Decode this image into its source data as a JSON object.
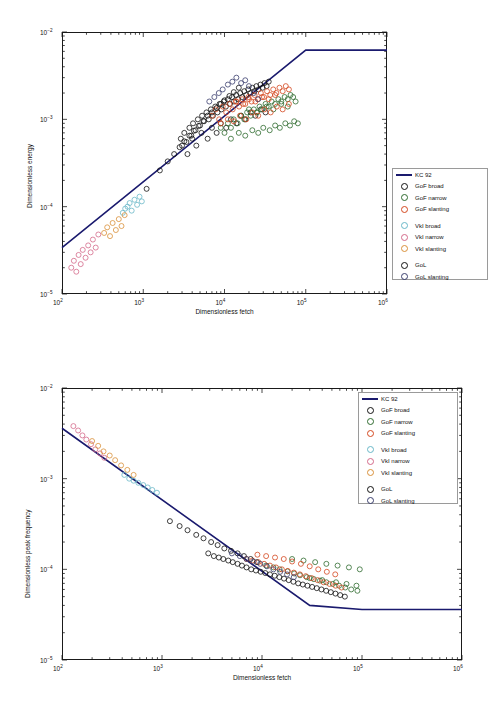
{
  "figure": {
    "panels": [
      {
        "label": "(a)"
      },
      {
        "label": "(b)"
      }
    ]
  },
  "legend": {
    "items": [
      {
        "type": "line",
        "label": "KC 92",
        "color": "#1a1a6e"
      },
      {
        "type": "circle",
        "label": "GoF broad",
        "color": "#111111"
      },
      {
        "type": "circle",
        "label": "GoF narrow",
        "color": "#2f6b2f"
      },
      {
        "type": "circle",
        "label": "GoF slanting",
        "color": "#d4481f"
      },
      {
        "type": "gap",
        "label": "",
        "color": ""
      },
      {
        "type": "circle",
        "label": "VkI broad",
        "color": "#69b7c8"
      },
      {
        "type": "circle",
        "label": "VkI narrow",
        "color": "#d46a8a"
      },
      {
        "type": "circle",
        "label": "VkI slanting",
        "color": "#d9913a"
      },
      {
        "type": "gap",
        "label": "",
        "color": ""
      },
      {
        "type": "circle",
        "label": "GoL",
        "color": "#111111"
      },
      {
        "type": "circle",
        "label": "GoL slanting",
        "color": "#3b3f6e"
      }
    ]
  },
  "chart_data": [
    {
      "type": "scatter",
      "panel": "(a)",
      "title": "",
      "xlabel": "Dimensionless fetch",
      "ylabel": "Dimensionless energy",
      "xscale": "log",
      "yscale": "log",
      "xlim": [
        100,
        1000000
      ],
      "ylim": [
        1e-05,
        0.01
      ],
      "xticks": [
        "10^2",
        "10^3",
        "10^4",
        "10^5",
        "10^6"
      ],
      "yticks": [
        "10^-5",
        "10^-4",
        "10^-3",
        "10^-2"
      ],
      "grid": false,
      "legend_position": "right-outside",
      "series": [
        {
          "name": "KC 92",
          "type": "line",
          "color": "#1a1a6e",
          "points": [
            [
              100,
              3.4e-05
            ],
            [
              100000,
              0.0062
            ],
            [
              1000000,
              0.0062
            ]
          ]
        },
        {
          "name": "GoF broad",
          "color": "#111111",
          "x": [
            2900,
            3200,
            3400,
            3700,
            3900,
            4100,
            4400,
            4700,
            5000,
            5300,
            5600,
            6000,
            6400,
            6800,
            7200,
            7700,
            8200,
            8700,
            9200,
            9800,
            10400,
            11000,
            11700,
            12400,
            13100,
            13900,
            14700,
            15600,
            16500,
            17500,
            18500,
            19600,
            20800,
            22000,
            23300,
            24700,
            26200,
            27700,
            29400,
            31100,
            33000,
            35000,
            3000,
            3500,
            4000,
            4500,
            5200,
            6200,
            7000,
            8000,
            9000,
            10500,
            12000,
            14000,
            16000,
            18000,
            21000,
            24000,
            28000,
            32000
          ],
          "y": [
            0.0006,
            0.0007,
            0.00055,
            0.0008,
            0.00065,
            0.0009,
            0.00075,
            0.001,
            0.00085,
            0.0011,
            0.00095,
            0.0012,
            0.001,
            0.0013,
            0.0011,
            0.0014,
            0.0012,
            0.0015,
            0.0013,
            0.0016,
            0.0014,
            0.0017,
            0.0015,
            0.0018,
            0.0016,
            0.0019,
            0.0017,
            0.002,
            0.0018,
            0.0021,
            0.0019,
            0.0022,
            0.002,
            0.0023,
            0.0021,
            0.0024,
            0.0022,
            0.0025,
            0.0023,
            0.0026,
            0.0024,
            0.0027,
            0.0005,
            0.0004,
            0.0006,
            0.0005,
            0.0007,
            0.0006,
            0.0008,
            0.0007,
            0.0009,
            0.0008,
            0.001,
            0.0009,
            0.0011,
            0.001,
            0.0012,
            0.0011,
            0.0013,
            0.0012
          ]
        },
        {
          "name": "GoF narrow",
          "color": "#2f6b2f",
          "x": [
            9000,
            10000,
            11000,
            12000,
            13000,
            14500,
            16000,
            17500,
            19000,
            21000,
            23000,
            25000,
            27000,
            29000,
            32000,
            35000,
            38000,
            42000,
            46000,
            50000,
            55000,
            60000,
            65000,
            70000,
            12000,
            15000,
            18000,
            22000,
            26000,
            30000,
            36000,
            42000,
            48000,
            56000,
            64000,
            72000,
            80000,
            20000,
            25000,
            33000,
            40000,
            50000,
            60000,
            75000
          ],
          "y": [
            0.0008,
            0.0007,
            0.0009,
            0.0008,
            0.001,
            0.0009,
            0.0011,
            0.001,
            0.0012,
            0.0011,
            0.0013,
            0.0012,
            0.0014,
            0.0013,
            0.0015,
            0.0014,
            0.0016,
            0.0015,
            0.0017,
            0.0016,
            0.0018,
            0.0017,
            0.0019,
            0.0018,
            0.0006,
            0.0007,
            0.00065,
            0.00075,
            0.0007,
            0.0008,
            0.00075,
            0.00085,
            0.0008,
            0.0009,
            0.00085,
            0.00095,
            0.0009,
            0.0013,
            0.0012,
            0.0014,
            0.0013,
            0.0015,
            0.0014,
            0.0016
          ]
        },
        {
          "name": "GoF slanting",
          "color": "#d4481f",
          "x": [
            7000,
            7800,
            8600,
            9500,
            10500,
            11500,
            12600,
            13800,
            15100,
            16500,
            18000,
            19700,
            21500,
            23500,
            25700,
            28000,
            30600,
            33400,
            36500,
            39800,
            43500,
            47500,
            52000,
            56800,
            62000,
            9000,
            11000,
            13000,
            15500,
            18500,
            22000,
            26000,
            31000,
            37000,
            44000,
            52000,
            62000,
            14000,
            17000,
            20000,
            24000,
            29000,
            35000,
            42000
          ],
          "y": [
            0.0011,
            0.0013,
            0.001,
            0.0014,
            0.0012,
            0.0015,
            0.0013,
            0.0016,
            0.0014,
            0.0017,
            0.0015,
            0.0018,
            0.0016,
            0.0019,
            0.0017,
            0.002,
            0.0018,
            0.0021,
            0.0019,
            0.0022,
            0.002,
            0.0023,
            0.0021,
            0.0024,
            0.0022,
            0.0009,
            0.001,
            0.00095,
            0.0011,
            0.001,
            0.0012,
            0.0011,
            0.0013,
            0.0012,
            0.0014,
            0.0013,
            0.0015,
            0.0016,
            0.0015,
            0.0017,
            0.0016,
            0.0018,
            0.0017,
            0.0019
          ]
        },
        {
          "name": "VkI broad",
          "color": "#69b7c8",
          "x": [
            560,
            600,
            640,
            680,
            720,
            780,
            840,
            900,
            960
          ],
          "y": [
            8.5e-05,
            9.5e-05,
            0.0001,
            0.00011,
            9e-05,
            0.00012,
            0.000105,
            0.00013,
            0.000115
          ]
        },
        {
          "name": "VkI narrow",
          "color": "#d46a8a",
          "x": [
            130,
            140,
            150,
            160,
            170,
            180,
            195,
            210,
            225,
            240,
            260,
            280
          ],
          "y": [
            2e-05,
            2.4e-05,
            1.8e-05,
            2.8e-05,
            2.2e-05,
            3.2e-05,
            2.6e-05,
            3.6e-05,
            3e-05,
            4.2e-05,
            3.4e-05,
            4.8e-05
          ]
        },
        {
          "name": "VkI slanting",
          "color": "#d9913a",
          "x": [
            330,
            360,
            390,
            420,
            460,
            500,
            540,
            590
          ],
          "y": [
            5e-05,
            5.8e-05,
            4.6e-05,
            6.5e-05,
            5.4e-05,
            7.2e-05,
            6e-05,
            8e-05
          ]
        },
        {
          "name": "GoL",
          "color": "#111111",
          "x": [
            1100,
            1600,
            2000,
            2400,
            2800,
            3200,
            3700,
            4200,
            4800,
            5500,
            6200,
            7000,
            8000,
            9000,
            10000,
            11500,
            13000,
            15000
          ],
          "y": [
            0.00016,
            0.00026,
            0.00033,
            0.0004,
            0.00048,
            0.00056,
            0.00065,
            0.00074,
            0.00084,
            0.00096,
            0.0011,
            0.0012,
            0.00135,
            0.0015,
            0.00165,
            0.00185,
            0.00205,
            0.0023
          ]
        },
        {
          "name": "GoL slanting",
          "color": "#3b3f6e",
          "x": [
            6500,
            7500,
            8500,
            9500,
            11000,
            12500,
            14000,
            16000,
            18000,
            20000,
            23000,
            26000
          ],
          "y": [
            0.0016,
            0.0018,
            0.002,
            0.0022,
            0.0025,
            0.0027,
            0.003,
            0.0026,
            0.0028,
            0.0024,
            0.002,
            0.0017
          ]
        }
      ]
    },
    {
      "type": "scatter",
      "panel": "(b)",
      "title": "",
      "xlabel": "Dimensionless fetch",
      "ylabel": "Dimensionless peak frequency",
      "xscale": "log",
      "yscale": "log",
      "xlim": [
        100,
        1000000
      ],
      "ylim": [
        1e-05,
        0.01
      ],
      "xticks": [
        "10^2",
        "10^3",
        "10^4",
        "10^5",
        "10^6"
      ],
      "yticks": [
        "10^-5",
        "10^-4",
        "10^-3",
        "10^-2"
      ],
      "grid": false,
      "legend_position": "top-right-inside",
      "series": [
        {
          "name": "KC 92",
          "type": "line",
          "color": "#1a1a6e",
          "points": [
            [
              100,
              0.0036
            ],
            [
              30000,
              4e-05
            ],
            [
              100000,
              3.6e-05
            ],
            [
              1000000,
              3.6e-05
            ]
          ]
        },
        {
          "name": "GoF broad",
          "color": "#111111",
          "x": [
            2900,
            3300,
            3700,
            4100,
            4600,
            5100,
            5700,
            6300,
            7000,
            7800,
            8700,
            9700,
            10800,
            12000,
            13400,
            14900,
            16600,
            18500,
            20600,
            23000,
            25600,
            28500,
            31700,
            35300,
            39300,
            43800,
            48800,
            54300,
            60500,
            67400
          ],
          "y": [
            0.00015,
            0.00014,
            0.000135,
            0.00013,
            0.000125,
            0.00012,
            0.000115,
            0.00011,
            0.000105,
            0.0001,
            9.7e-05,
            9.4e-05,
            9.1e-05,
            8.8e-05,
            8.5e-05,
            8.2e-05,
            7.9e-05,
            7.6e-05,
            7.3e-05,
            7e-05,
            6.8e-05,
            6.6e-05,
            6.4e-05,
            6.2e-05,
            6e-05,
            5.8e-05,
            5.6e-05,
            5.4e-05,
            5.2e-05,
            5e-05
          ]
        },
        {
          "name": "GoF narrow",
          "color": "#2f6b2f",
          "x": [
            11000,
            13000,
            15000,
            18000,
            21000,
            24000,
            28000,
            33000,
            38000,
            44000,
            51000,
            59000,
            68000,
            78000,
            90000,
            20000,
            26000,
            34000,
            44000,
            57000,
            74000,
            95000,
            30000,
            40000,
            55000,
            70000,
            88000
          ],
          "y": [
            0.00011,
            0.000105,
            0.0001,
            9.5e-05,
            9e-05,
            8.6e-05,
            8.2e-05,
            7.8e-05,
            7.5e-05,
            7.2e-05,
            6.9e-05,
            6.6e-05,
            6.3e-05,
            6e-05,
            5.8e-05,
            0.00013,
            0.000125,
            0.00012,
            0.000115,
            0.00011,
            0.000105,
            0.0001,
            8e-05,
            7.6e-05,
            7.2e-05,
            6.9e-05,
            6.6e-05
          ]
        },
        {
          "name": "GoF slanting",
          "color": "#d4481f",
          "x": [
            7000,
            8000,
            9200,
            10500,
            12000,
            13800,
            15800,
            18100,
            20800,
            23900,
            27400,
            31400,
            36000,
            41300,
            47400,
            54400,
            62400,
            9000,
            11000,
            13500,
            16500,
            20000,
            24500,
            30000,
            36500,
            44500,
            54000
          ],
          "y": [
            0.00013,
            0.000125,
            0.00012,
            0.000115,
            0.00011,
            0.000105,
            0.0001,
            9.6e-05,
            9.2e-05,
            8.8e-05,
            8.4e-05,
            8e-05,
            7.6e-05,
            7.2e-05,
            6.9e-05,
            6.6e-05,
            6.3e-05,
            0.000145,
            0.00014,
            0.000135,
            0.00013,
            0.000122,
            0.000115,
            0.000108,
            0.0001,
            9.4e-05,
            8.8e-05
          ]
        },
        {
          "name": "VkI broad",
          "color": "#69b7c8",
          "x": [
            420,
            470,
            520,
            580,
            650,
            720,
            800,
            890
          ],
          "y": [
            0.0011,
            0.001,
            0.00095,
            0.0009,
            0.00085,
            0.0008,
            0.00075,
            0.0007
          ]
        },
        {
          "name": "VkI narrow",
          "color": "#d46a8a",
          "x": [
            130,
            145,
            160,
            175,
            195,
            215,
            240,
            265
          ],
          "y": [
            0.0038,
            0.0034,
            0.003,
            0.0027,
            0.0024,
            0.0021,
            0.0019,
            0.0017
          ]
        },
        {
          "name": "VkI slanting",
          "color": "#d9913a",
          "x": [
            200,
            230,
            260,
            300,
            340,
            390,
            450,
            520
          ],
          "y": [
            0.0026,
            0.0023,
            0.002,
            0.0018,
            0.0016,
            0.0014,
            0.00125,
            0.0011
          ]
        },
        {
          "name": "GoL",
          "color": "#111111",
          "x": [
            1200,
            1500,
            1800,
            2200,
            2600,
            3100,
            3600,
            4200,
            4900,
            5700,
            6600,
            7700,
            8900
          ],
          "y": [
            0.00034,
            0.0003,
            0.00027,
            0.00024,
            0.00022,
            0.0002,
            0.000185,
            0.00017,
            0.00016,
            0.00015,
            0.00014,
            0.00013,
            0.00012
          ]
        },
        {
          "name": "GoL slanting",
          "color": "#3b3f6e",
          "x": [
            5000,
            6000,
            7000,
            8200,
            9600,
            11200,
            13000,
            15200,
            17800,
            20800
          ],
          "y": [
            0.00015,
            0.00014,
            0.00013,
            0.000122,
            0.000115,
            0.000108,
            0.0001,
            9.4e-05,
            8.8e-05,
            8.2e-05
          ]
        }
      ]
    }
  ]
}
